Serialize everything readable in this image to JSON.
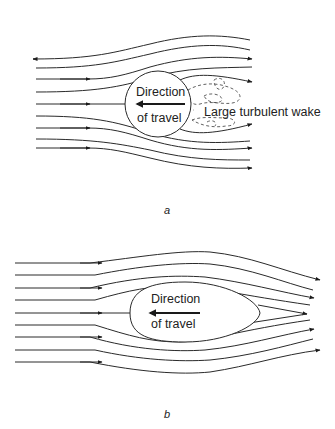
{
  "figure": {
    "panel_a": {
      "caption": "a",
      "body_label_line1": "Direction",
      "body_label_line2": "of travel",
      "wake_label": "Large turbulent wake",
      "body_shape": "circle"
    },
    "panel_b": {
      "caption": "b",
      "body_label_line1": "Direction",
      "body_label_line2": "of travel",
      "body_shape": "streamlined teardrop"
    },
    "colors": {
      "line": "#2a2a2a",
      "background": "#ffffff"
    }
  }
}
